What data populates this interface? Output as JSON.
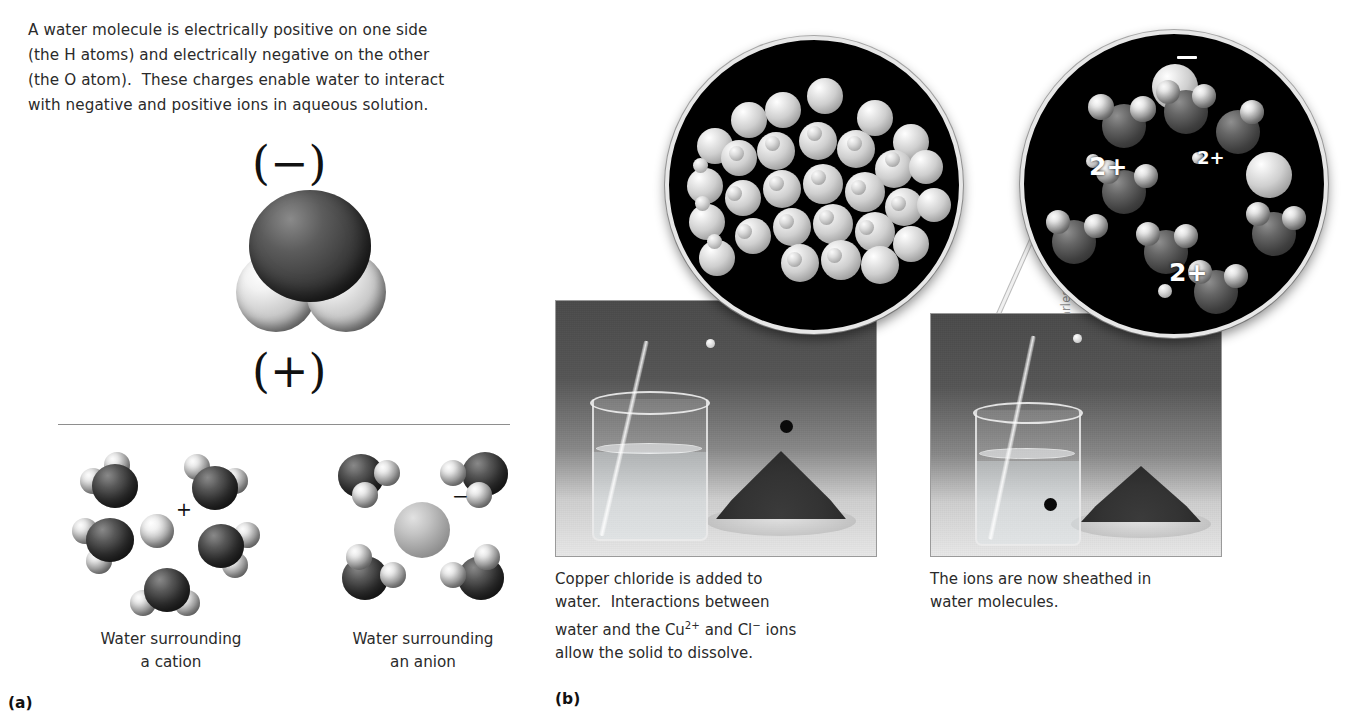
{
  "figure": {
    "panel_a_label": "(a)",
    "panel_b_label": "(b)",
    "credit": "Photos: Charles D. Winters"
  },
  "panel_a": {
    "intro_lines": [
      "A water molecule is electrically positive on one side",
      "(the H atoms) and electrically negative on the other",
      "(the O atom).  These charges enable water to interact",
      "with negative and positive ions in aqueous solution."
    ],
    "negative_charge_label": "(−)",
    "positive_charge_label": "(+)",
    "cation_sign": "+",
    "anion_sign": "−",
    "cation_caption_line1": "Water surrounding",
    "cation_caption_line2": "a cation",
    "anion_caption_line1": "Water surrounding",
    "anion_caption_line2": "an anion"
  },
  "panel_b": {
    "left_caption_lines": [
      "Copper chloride is added to",
      "water.  Interactions between"
    ],
    "left_caption_ion_line": {
      "pre": "water and the Cu",
      "sup1": "2+",
      "mid": " and Cl",
      "sup2": "−",
      "post": " ions"
    },
    "left_caption_last": "allow the solid to dissolve.",
    "right_caption_lines": [
      "The ions are now sheathed in",
      "water molecules."
    ],
    "inset_right_labels": [
      {
        "text": "−",
        "kind": "minus",
        "x": 648,
        "y": 52,
        "size": 20
      },
      {
        "text": "2+",
        "kind": "text",
        "x": 560,
        "y": 150,
        "size": 25
      },
      {
        "text": "2+",
        "kind": "text",
        "x": 668,
        "y": 145,
        "size": 18
      },
      {
        "text": "−",
        "kind": "minus",
        "x": 800,
        "y": 160,
        "size": 20
      },
      {
        "text": "2+",
        "kind": "text",
        "x": 640,
        "y": 256,
        "size": 25
      },
      {
        "text": "−",
        "kind": "minus",
        "x": 785,
        "y": 252,
        "size": 13
      }
    ]
  },
  "colors": {
    "text": "#2a2a2a",
    "inset_background": "#000000",
    "inset_border": "#e7e7e7",
    "rule": "#8e8e8e",
    "label_white": "#ffffff"
  }
}
